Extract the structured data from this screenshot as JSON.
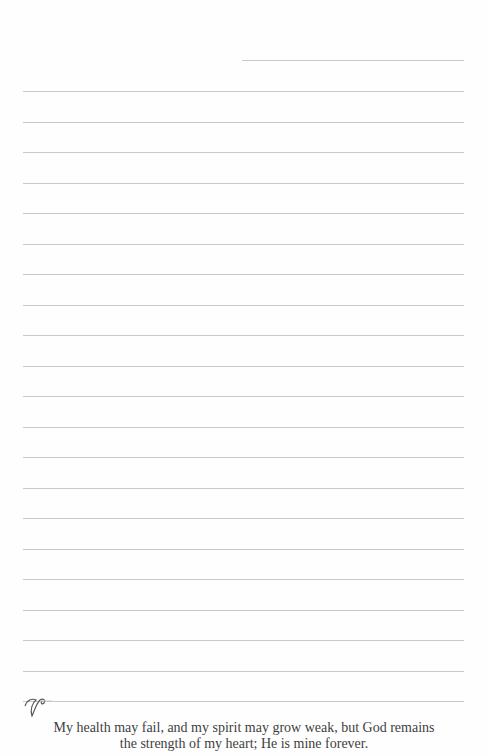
{
  "page": {
    "line_color": "#c9c9c9",
    "text_color": "#3f3f3f",
    "header_line": {
      "left": 242,
      "right": 464,
      "y": 60
    },
    "ruled_lines": {
      "left": 23,
      "right": 464,
      "first_y": 91,
      "spacing": 30.5,
      "count": 21
    },
    "verse": {
      "line1": "My health may fail, and my spirit may grow weak, but God remains",
      "line2": "the strength of my heart; He is mine forever."
    },
    "ornament": "flourish-icon"
  }
}
